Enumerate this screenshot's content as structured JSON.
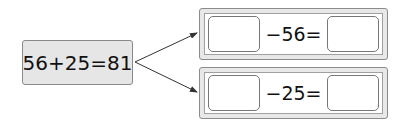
{
  "source_equation": "56+25=81",
  "rows": [
    {
      "operator_text": "−56=",
      "blank_left": "",
      "blank_right": ""
    },
    {
      "operator_text": "−25=",
      "blank_left": "",
      "blank_right": ""
    }
  ],
  "colors": {
    "box_fill": "#e6e6e6",
    "border": "#8a8a8a",
    "text": "#111111"
  }
}
